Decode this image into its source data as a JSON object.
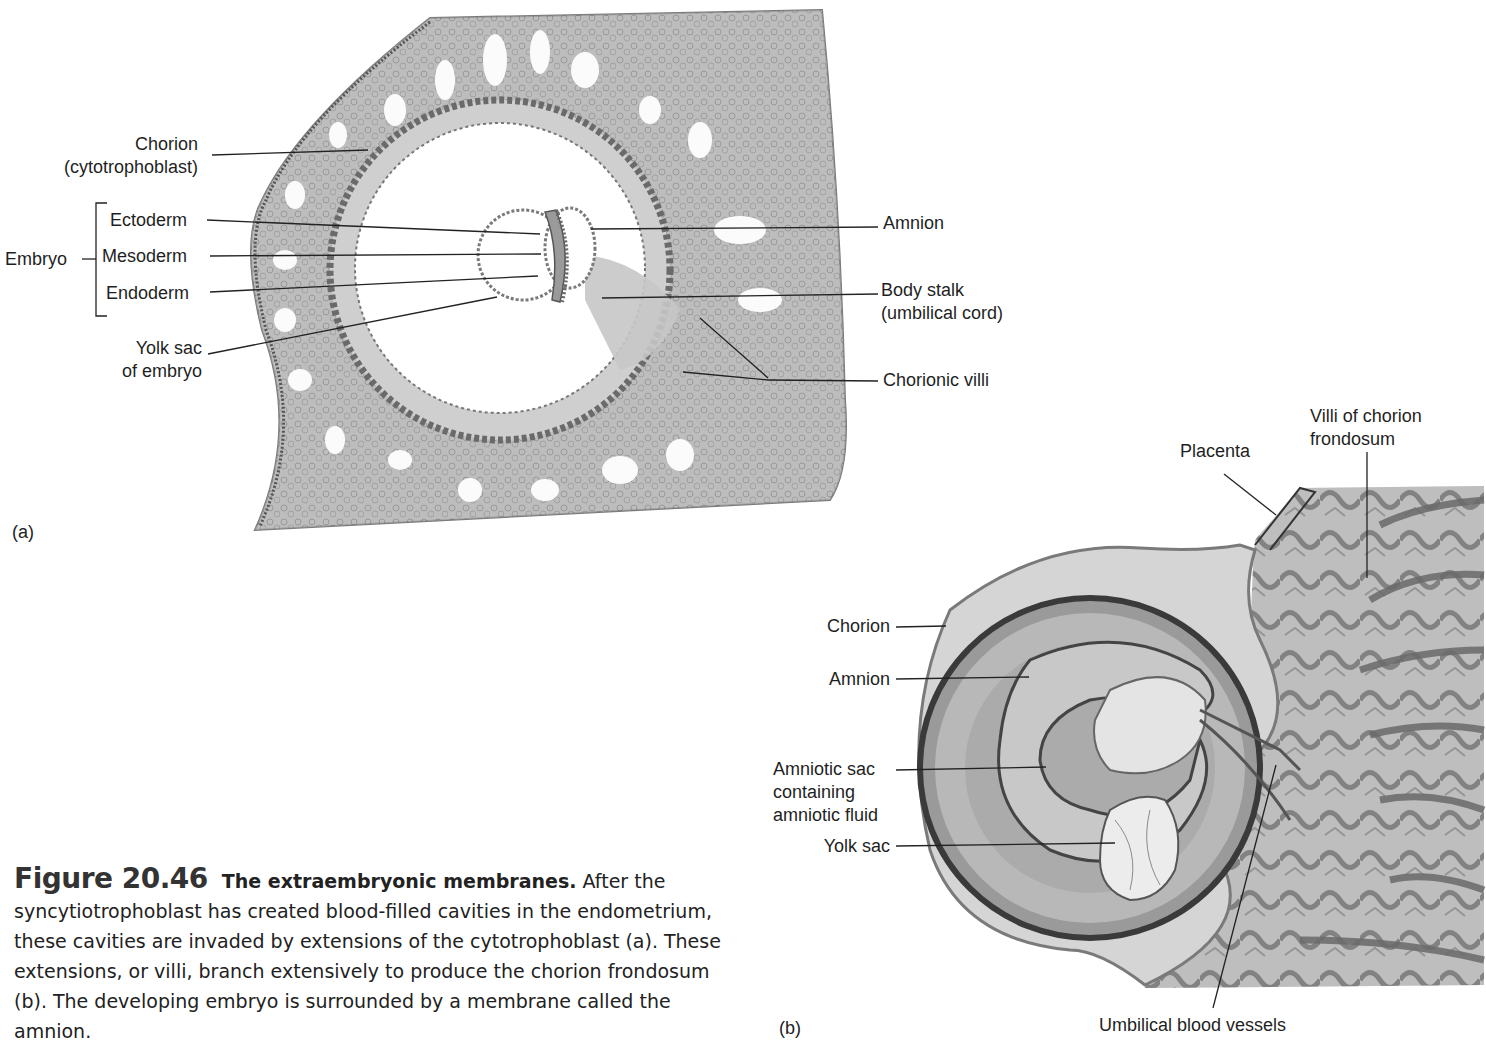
{
  "figure": {
    "number": "Figure 20.46",
    "title": "The extraembryonic membranes.",
    "caption_body": "After the syncytiotrophoblast has created blood-filled cavities in the endometrium, these cavities are invaded by extensions of the cytotrophoblast (a). These extensions, or villi, branch extensively to produce the chorion frondosum (b). The developing embryo is surrounded by a membrane called the amnion."
  },
  "panel_a": {
    "tag": "(a)",
    "labels": {
      "chorion_line1": "Chorion",
      "chorion_line2": "(cytotrophoblast)",
      "embryo": "Embryo",
      "ectoderm": "Ectoderm",
      "mesoderm": "Mesoderm",
      "endoderm": "Endoderm",
      "yolk_sac_line1": "Yolk sac",
      "yolk_sac_line2": "of embryo",
      "amnion": "Amnion",
      "body_stalk_line1": "Body stalk",
      "body_stalk_line2": "(umbilical cord)",
      "chorionic_villi": "Chorionic villi"
    }
  },
  "panel_b": {
    "tag": "(b)",
    "labels": {
      "placenta": "Placenta",
      "villi_line1": "Villi of chorion",
      "villi_line2": "frondosum",
      "chorion": "Chorion",
      "amnion": "Amnion",
      "amniotic_sac_line1": "Amniotic sac",
      "amniotic_sac_line2": "containing",
      "amniotic_sac_line3": "amniotic fluid",
      "yolk_sac": "Yolk sac",
      "umbilical_vessels": "Umbilical blood vessels"
    }
  }
}
